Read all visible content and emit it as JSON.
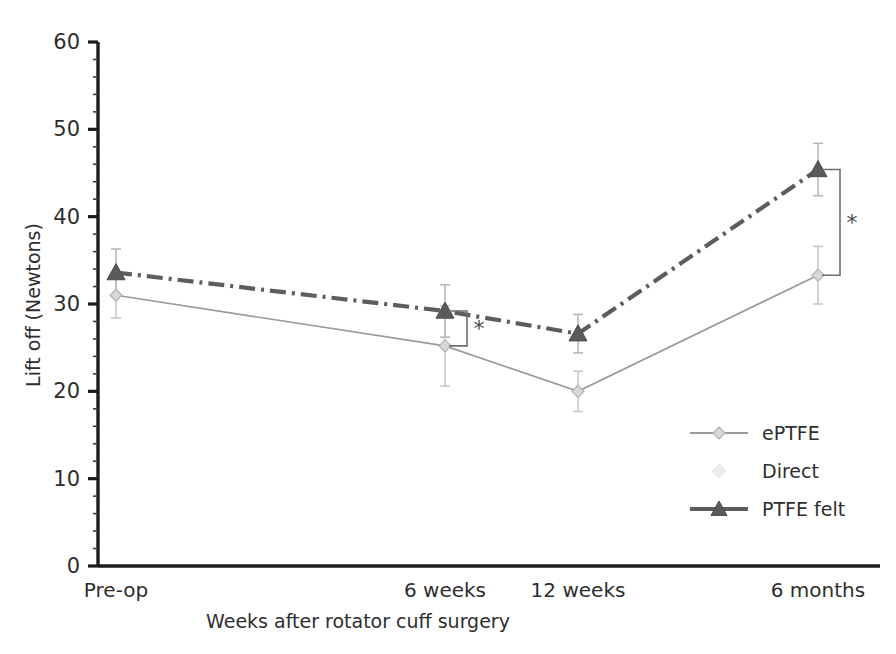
{
  "chart_data": {
    "type": "line",
    "title": "",
    "xlabel": "Weeks after rotator cuff surgery",
    "ylabel": "Lift off (Newtons)",
    "categories": [
      "Pre-op",
      "6 weeks",
      "12 weeks",
      "6 months"
    ],
    "ylim": [
      0,
      60
    ],
    "ytick_labels": [
      "0",
      "10",
      "20",
      "30",
      "40",
      "50",
      "60"
    ],
    "ytick_values": [
      0,
      10,
      20,
      30,
      40,
      50,
      60
    ],
    "yminor_step": 2,
    "grid": false,
    "legend_position": "inside-right-lower",
    "series": [
      {
        "name": "ePTFE",
        "marker": "diamond",
        "line_style": "solid",
        "color": "#9a9a9a",
        "values": [
          31.0,
          25.2,
          20.0,
          33.3
        ],
        "errors": [
          2.6,
          4.6,
          2.3,
          3.3
        ]
      },
      {
        "name": "Direct",
        "marker": "none",
        "line_style": "none",
        "color": "#ededed",
        "values": [
          null,
          null,
          null,
          null
        ],
        "errors": [
          null,
          null,
          null,
          null
        ]
      },
      {
        "name": "PTFE felt",
        "marker": "triangle",
        "line_style": "dash-dot",
        "color": "#5d5d5d",
        "values": [
          33.6,
          29.2,
          26.6,
          45.4
        ],
        "errors": [
          2.7,
          3.0,
          2.2,
          3.0
        ]
      }
    ],
    "annotations": [
      {
        "name": "significance-6weeks",
        "label": "*",
        "category": "6 weeks",
        "between": [
          "ePTFE",
          "PTFE felt"
        ]
      },
      {
        "name": "significance-6months",
        "label": "*",
        "category": "6 months",
        "between": [
          "ePTFE",
          "PTFE felt"
        ]
      }
    ]
  },
  "legend": {
    "items": [
      {
        "label": "ePTFE",
        "marker": "diamond-marker"
      },
      {
        "label": "Direct",
        "marker": "faint-marker"
      },
      {
        "label": "PTFE felt",
        "marker": "triangle-marker"
      }
    ]
  }
}
